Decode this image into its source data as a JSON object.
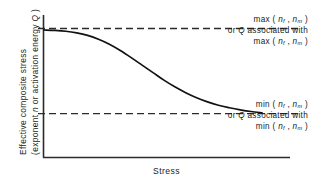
{
  "chart_data": {
    "type": "line",
    "title": "",
    "xlabel": "Stress",
    "ylabel_line1": "Effective composite stress",
    "ylabel_line2": "(exponent n or activation energy Q )",
    "grid": false,
    "legend": "none",
    "xlim": [
      0,
      1
    ],
    "ylim": [
      0,
      1
    ],
    "axis_ticks": "none",
    "series": [
      {
        "name": "effective-composite-response",
        "shape": "sigmoid-decreasing",
        "x": [
          0.0,
          0.05,
          0.1,
          0.15,
          0.2,
          0.25,
          0.3,
          0.35,
          0.4,
          0.45,
          0.5,
          0.55,
          0.6,
          0.65,
          0.7,
          0.75,
          0.8,
          0.85,
          0.9,
          0.95,
          1.0
        ],
        "y": [
          1.0,
          0.995,
          0.985,
          0.965,
          0.935,
          0.89,
          0.83,
          0.755,
          0.67,
          0.58,
          0.49,
          0.4,
          0.32,
          0.25,
          0.19,
          0.14,
          0.1,
          0.07,
          0.045,
          0.025,
          0.01
        ]
      }
    ],
    "reference_lines": [
      {
        "name": "upper-asymptote",
        "y": 1.0,
        "style": "dashed",
        "label_lines": [
          "max ( n_f , n_m )",
          "or Q associated with",
          "max ( n_f , n_m )"
        ]
      },
      {
        "name": "lower-asymptote",
        "y": 0.0,
        "style": "dashed",
        "label_lines": [
          "min ( n_f , n_m )",
          "or Q associated with",
          "min ( n_f , n_m )"
        ]
      }
    ]
  },
  "annotations": {
    "max": {
      "line1_prefix": "max ( ",
      "line1_sym1": "n",
      "line1_sub1": "f",
      "line1_mid": " , ",
      "line1_sym2": "n",
      "line1_sub2": "m",
      "line1_suffix": " )",
      "line2_prefix": "or ",
      "line2_sym": "Q",
      "line2_suffix": " associated with",
      "line3_prefix": "max ( ",
      "line3_sym1": "n",
      "line3_sub1": "f",
      "line3_mid": " , ",
      "line3_sym2": "n",
      "line3_sub2": "m",
      "line3_suffix": " )"
    },
    "min": {
      "line1_prefix": "min ( ",
      "line1_sym1": "n",
      "line1_sub1": "f",
      "line1_mid": " , ",
      "line1_sym2": "n",
      "line1_sub2": "m",
      "line1_suffix": " )",
      "line2_prefix": "or ",
      "line2_sym": "Q",
      "line2_suffix": " associated with",
      "line3_prefix": "min ( ",
      "line3_sym1": "n",
      "line3_sub1": "f",
      "line3_mid": " , ",
      "line3_sym2": "n",
      "line3_sub2": "m",
      "line3_suffix": " )"
    }
  },
  "axes": {
    "x_label": "Stress",
    "y_label_part1": "Effective composite stress",
    "y_label_part2_prefix": "(exponent ",
    "y_label_part2_sym1": "n",
    "y_label_part2_mid": " or activation energy ",
    "y_label_part2_sym2": "Q",
    "y_label_part2_suffix": " )"
  },
  "colors": {
    "axis": "#2b2b2b",
    "curve": "#111111",
    "dashed": "#2b2b2b",
    "text": "#1a1a1a",
    "background": "#ffffff"
  }
}
